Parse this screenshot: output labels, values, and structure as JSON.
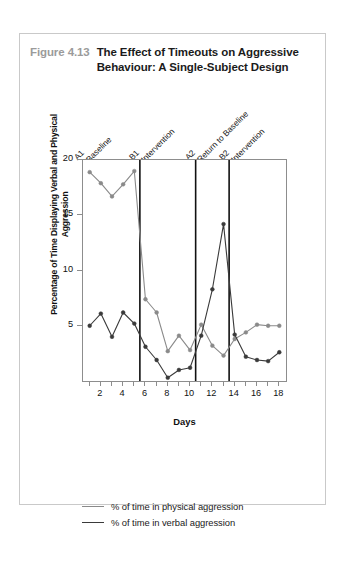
{
  "figure": {
    "number": "Figure 4.13",
    "title": "The Effect of Timeouts on Aggressive Behaviour: A Single-Subject Design"
  },
  "colors": {
    "physical_line": "#8a8a8a",
    "verbal_line": "#3a3a3a",
    "frame": "#8d8d8d",
    "divider": "#111111",
    "figure_number": "#9b9b9b",
    "title_text": "#1b1b1b",
    "card_border": "#c9c9c9"
  },
  "phases": [
    {
      "code": "A1",
      "desc": "Baseline",
      "start_day": 1,
      "end_day": 5
    },
    {
      "code": "B1",
      "desc": "Intervention",
      "start_day": 6,
      "end_day": 10
    },
    {
      "code": "A2",
      "desc": "Return to Baseline",
      "start_day": 11,
      "end_day": 13
    },
    {
      "code": "B2",
      "desc": "Intervention",
      "start_day": 14,
      "end_day": 18
    }
  ],
  "phase_dividers": [
    5.5,
    10.5,
    13.5
  ],
  "legend": [
    {
      "label": "% of time in physical aggression",
      "color": "#8a8a8a"
    },
    {
      "label": "% of time in verbal aggression",
      "color": "#3a3a3a"
    }
  ],
  "chart_data": {
    "type": "line",
    "title": "The Effect of Timeouts on Aggressive Behaviour: A Single-Subject Design",
    "xlabel": "Days",
    "ylabel": "Percentage of Time Displaying Verbal and Physical Aggression",
    "x": [
      1,
      2,
      3,
      4,
      5,
      6,
      7,
      8,
      9,
      10,
      11,
      12,
      13,
      14,
      15,
      16,
      17,
      18
    ],
    "xlim": [
      0.4,
      18.6
    ],
    "ylim": [
      0,
      20
    ],
    "xticks": [
      2,
      4,
      6,
      8,
      10,
      12,
      14,
      16,
      18
    ],
    "yticks": [
      5,
      10,
      15,
      20
    ],
    "grid": false,
    "legend_position": "below",
    "series": [
      {
        "name": "% of time in physical aggression",
        "color": "#8a8a8a",
        "values": [
          18.9,
          17.9,
          16.7,
          17.8,
          19.0,
          7.4,
          6.2,
          2.7,
          4.1,
          2.8,
          5.1,
          3.2,
          2.3,
          3.8,
          4.4,
          5.1,
          5.0,
          5.0
        ]
      },
      {
        "name": "% of time in verbal aggression",
        "color": "#3a3a3a",
        "values": [
          5.0,
          6.1,
          4.0,
          6.2,
          5.2,
          3.1,
          1.9,
          0.3,
          1.0,
          1.2,
          4.1,
          8.3,
          14.2,
          4.2,
          2.2,
          1.9,
          1.8,
          2.6
        ]
      }
    ]
  }
}
